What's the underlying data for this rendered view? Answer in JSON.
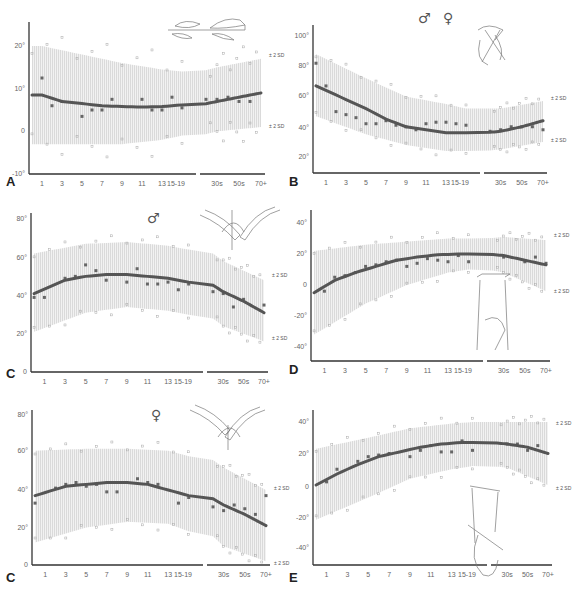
{
  "figure": {
    "panels": [
      "A",
      "B",
      "C (male)",
      "D",
      "C (female)",
      "E"
    ]
  },
  "chart_data": [
    {
      "panel": "A",
      "type": "scatter",
      "title": "",
      "sex_symbols": [],
      "x_tick_labels": [
        "1",
        "3",
        "5",
        "7",
        "9",
        "11",
        "13",
        "15-19",
        "30s",
        "50s",
        "70+"
      ],
      "y_tick_labels": [
        "20°",
        "10°",
        "0",
        "-10°"
      ],
      "ylim": [
        -10,
        25
      ],
      "annotations": [
        "± 2 SD",
        "± 2 SD"
      ],
      "mean_curve": [
        [
          1,
          8.5
        ],
        [
          3,
          7
        ],
        [
          5,
          6.5
        ],
        [
          7,
          6
        ],
        [
          9,
          5.8
        ],
        [
          11,
          5.7
        ],
        [
          13,
          5.8
        ],
        [
          15,
          6.2
        ],
        [
          30,
          7
        ],
        [
          50,
          8
        ],
        [
          70,
          9
        ]
      ],
      "band_upper": [
        [
          1,
          20
        ],
        [
          5,
          18
        ],
        [
          9,
          16
        ],
        [
          13,
          14.5
        ],
        [
          15,
          14
        ],
        [
          30,
          15
        ],
        [
          70,
          17
        ]
      ],
      "band_lower": [
        [
          1,
          -3
        ],
        [
          5,
          -3
        ],
        [
          9,
          -3
        ],
        [
          13,
          -2
        ],
        [
          15,
          -1
        ],
        [
          30,
          0
        ],
        [
          70,
          1
        ]
      ],
      "mean_points": [
        [
          1,
          12.5
        ],
        [
          2,
          6
        ],
        [
          3,
          7
        ],
        [
          5,
          3.5
        ],
        [
          6,
          5
        ],
        [
          7,
          5
        ],
        [
          8,
          7.5
        ],
        [
          11,
          7.5
        ],
        [
          12,
          5
        ],
        [
          13,
          5
        ],
        [
          14,
          8
        ],
        [
          15,
          5.5
        ],
        [
          20,
          7.5
        ],
        [
          30,
          7.5
        ],
        [
          40,
          8
        ],
        [
          50,
          7
        ],
        [
          60,
          7
        ]
      ]
    },
    {
      "panel": "B",
      "type": "scatter",
      "sex_symbols": [
        "♂",
        "♀"
      ],
      "x_tick_labels": [
        "1",
        "3",
        "5",
        "7",
        "9",
        "11",
        "13",
        "15-19",
        "30s",
        "50s",
        "70+"
      ],
      "y_tick_labels": [
        "100°",
        "80°",
        "60°",
        "40°",
        "20°"
      ],
      "ylim": [
        10,
        105
      ],
      "annotations": [
        "± 2 SD",
        "± 2 SD"
      ],
      "mean_curve": [
        [
          0,
          67
        ],
        [
          3,
          58
        ],
        [
          5,
          52
        ],
        [
          7,
          45
        ],
        [
          9,
          40
        ],
        [
          11,
          38
        ],
        [
          13,
          36
        ],
        [
          15,
          36
        ],
        [
          30,
          37
        ],
        [
          50,
          40
        ],
        [
          70,
          44
        ]
      ],
      "band_upper": [
        [
          0,
          88
        ],
        [
          5,
          72
        ],
        [
          9,
          60
        ],
        [
          13,
          55
        ],
        [
          15,
          52
        ],
        [
          30,
          52
        ],
        [
          70,
          57
        ]
      ],
      "band_lower": [
        [
          0,
          47
        ],
        [
          5,
          35
        ],
        [
          9,
          28
        ],
        [
          13,
          24
        ],
        [
          15,
          24
        ],
        [
          30,
          25
        ],
        [
          70,
          30
        ]
      ],
      "mean_points": [
        [
          0,
          82
        ],
        [
          1,
          67
        ],
        [
          2,
          50
        ],
        [
          3,
          48
        ],
        [
          4,
          46
        ],
        [
          5,
          42
        ],
        [
          6,
          42
        ],
        [
          7,
          44
        ],
        [
          8,
          41
        ],
        [
          9,
          40
        ],
        [
          10,
          38
        ],
        [
          11,
          42
        ],
        [
          12,
          43
        ],
        [
          13,
          43
        ],
        [
          14,
          42
        ],
        [
          15,
          41
        ],
        [
          20,
          37
        ],
        [
          30,
          38
        ],
        [
          40,
          40
        ],
        [
          50,
          40
        ],
        [
          60,
          40
        ],
        [
          70,
          38
        ]
      ]
    },
    {
      "panel": "C-male",
      "type": "scatter",
      "sex_symbols": [
        "♂"
      ],
      "x_tick_labels": [
        "1",
        "3",
        "5",
        "7",
        "9",
        "11",
        "13",
        "15-19",
        "30s",
        "50s",
        "70+"
      ],
      "y_tick_labels": [
        "80°",
        "60°",
        "40°",
        "20°",
        "0"
      ],
      "ylim": [
        0,
        80
      ],
      "annotations": [
        "± 2 SD",
        "± 2 SD"
      ],
      "mean_curve": [
        [
          0,
          41
        ],
        [
          3,
          48
        ],
        [
          5,
          50
        ],
        [
          7,
          51
        ],
        [
          9,
          51
        ],
        [
          11,
          50
        ],
        [
          13,
          49
        ],
        [
          15,
          47
        ],
        [
          30,
          42
        ],
        [
          50,
          37
        ],
        [
          70,
          31
        ]
      ],
      "band_upper": [
        [
          0,
          62
        ],
        [
          5,
          67
        ],
        [
          9,
          68
        ],
        [
          13,
          66
        ],
        [
          15,
          64
        ],
        [
          30,
          58
        ],
        [
          70,
          48
        ]
      ],
      "band_lower": [
        [
          0,
          21
        ],
        [
          5,
          31
        ],
        [
          9,
          34
        ],
        [
          13,
          32
        ],
        [
          15,
          30
        ],
        [
          30,
          24
        ],
        [
          70,
          16
        ]
      ],
      "mean_points": [
        [
          0,
          39
        ],
        [
          1,
          39
        ],
        [
          3,
          49
        ],
        [
          4,
          50
        ],
        [
          5,
          56
        ],
        [
          6,
          53
        ],
        [
          7,
          48
        ],
        [
          9,
          47
        ],
        [
          10,
          54
        ],
        [
          11,
          46
        ],
        [
          12,
          46
        ],
        [
          13,
          47
        ],
        [
          14,
          43
        ],
        [
          15,
          46
        ],
        [
          20,
          42
        ],
        [
          30,
          41
        ],
        [
          40,
          34
        ],
        [
          50,
          38
        ],
        [
          70,
          35
        ]
      ]
    },
    {
      "panel": "D",
      "type": "scatter",
      "sex_symbols": [],
      "x_tick_labels": [
        "1",
        "3",
        "5",
        "7",
        "9",
        "11",
        "13",
        "15-19",
        "30s",
        "50s",
        "70+"
      ],
      "y_tick_labels": [
        "40°",
        "20°",
        "0",
        "-20°",
        "-40°"
      ],
      "ylim": [
        -50,
        50
      ],
      "annotations": [
        "± 2 SD",
        "± 2 SD"
      ],
      "mean_curve": [
        [
          0,
          -5
        ],
        [
          2,
          3
        ],
        [
          4,
          8
        ],
        [
          6,
          12
        ],
        [
          8,
          16
        ],
        [
          10,
          18
        ],
        [
          12,
          19.5
        ],
        [
          14,
          20
        ],
        [
          15,
          20
        ],
        [
          30,
          19
        ],
        [
          50,
          16
        ],
        [
          70,
          13
        ]
      ],
      "band_upper": [
        [
          0,
          22
        ],
        [
          5,
          26
        ],
        [
          9,
          28
        ],
        [
          13,
          30
        ],
        [
          15,
          30
        ],
        [
          30,
          31
        ],
        [
          70,
          29
        ]
      ],
      "band_lower": [
        [
          0,
          -32
        ],
        [
          5,
          -12
        ],
        [
          9,
          0
        ],
        [
          13,
          8
        ],
        [
          15,
          10
        ],
        [
          30,
          8
        ],
        [
          70,
          -4
        ]
      ],
      "mean_points": [
        [
          1,
          -4
        ],
        [
          2,
          5
        ],
        [
          3,
          6
        ],
        [
          4,
          8
        ],
        [
          5,
          12
        ],
        [
          6,
          13
        ],
        [
          7,
          15
        ],
        [
          8,
          16
        ],
        [
          9,
          12
        ],
        [
          10,
          14
        ],
        [
          11,
          17
        ],
        [
          12,
          16
        ],
        [
          13,
          15
        ],
        [
          14,
          19
        ],
        [
          15,
          15
        ],
        [
          30,
          18
        ],
        [
          50,
          15
        ],
        [
          60,
          18
        ],
        [
          70,
          14
        ]
      ]
    },
    {
      "panel": "C-female",
      "type": "scatter",
      "sex_symbols": [
        "♀"
      ],
      "x_tick_labels": [
        "1",
        "3",
        "5",
        "7",
        "9",
        "11",
        "13",
        "15-19",
        "30s",
        "50s",
        "70+"
      ],
      "y_tick_labels": [
        "80°",
        "60°",
        "40°",
        "20°",
        "0"
      ],
      "ylim": [
        0,
        80
      ],
      "annotations": [
        "± 2 SD",
        "± 2 SD"
      ],
      "mean_curve": [
        [
          0,
          37
        ],
        [
          3,
          42
        ],
        [
          5,
          43
        ],
        [
          7,
          44
        ],
        [
          9,
          44
        ],
        [
          11,
          43
        ],
        [
          13,
          40
        ],
        [
          15,
          37
        ],
        [
          30,
          32
        ],
        [
          50,
          27
        ],
        [
          70,
          21
        ]
      ],
      "band_upper": [
        [
          0,
          61
        ],
        [
          5,
          62
        ],
        [
          9,
          62
        ],
        [
          13,
          61
        ],
        [
          15,
          58
        ],
        [
          30,
          52
        ],
        [
          70,
          40
        ]
      ],
      "band_lower": [
        [
          0,
          12
        ],
        [
          5,
          20
        ],
        [
          9,
          23
        ],
        [
          13,
          22
        ],
        [
          15,
          18
        ],
        [
          30,
          10
        ],
        [
          70,
          2
        ]
      ],
      "mean_points": [
        [
          0,
          33
        ],
        [
          2,
          41
        ],
        [
          3,
          43
        ],
        [
          4,
          44
        ],
        [
          5,
          42
        ],
        [
          6,
          43
        ],
        [
          7,
          39
        ],
        [
          8,
          39
        ],
        [
          10,
          46
        ],
        [
          11,
          44
        ],
        [
          12,
          43
        ],
        [
          14,
          33
        ],
        [
          15,
          36
        ],
        [
          20,
          31
        ],
        [
          30,
          29
        ],
        [
          40,
          32
        ],
        [
          50,
          30
        ],
        [
          60,
          27
        ],
        [
          70,
          37
        ]
      ]
    },
    {
      "panel": "E",
      "type": "scatter",
      "sex_symbols": [],
      "x_tick_labels": [
        "1",
        "3",
        "5",
        "7",
        "9",
        "11",
        "13",
        "15-19",
        "30s",
        "50s",
        "70+"
      ],
      "y_tick_labels": [
        "40°",
        "20°",
        "0",
        "-20°",
        "-40°"
      ],
      "ylim": [
        -50,
        50
      ],
      "annotations": [
        "± 2 SD",
        "± 2 SD"
      ],
      "mean_curve": [
        [
          0,
          0
        ],
        [
          2,
          7
        ],
        [
          4,
          13
        ],
        [
          6,
          18
        ],
        [
          8,
          21
        ],
        [
          10,
          24
        ],
        [
          12,
          26
        ],
        [
          14,
          27
        ],
        [
          15,
          27
        ],
        [
          30,
          26
        ],
        [
          50,
          24
        ],
        [
          70,
          20
        ]
      ],
      "band_upper": [
        [
          0,
          23
        ],
        [
          5,
          30
        ],
        [
          9,
          36
        ],
        [
          13,
          39
        ],
        [
          15,
          40
        ],
        [
          30,
          40
        ],
        [
          70,
          40
        ]
      ],
      "band_lower": [
        [
          0,
          -22
        ],
        [
          5,
          -8
        ],
        [
          9,
          4
        ],
        [
          13,
          10
        ],
        [
          15,
          12
        ],
        [
          30,
          11
        ],
        [
          70,
          0
        ]
      ],
      "mean_points": [
        [
          1,
          2
        ],
        [
          2,
          10
        ],
        [
          4,
          15
        ],
        [
          5,
          18
        ],
        [
          6,
          19
        ],
        [
          7,
          20
        ],
        [
          9,
          18
        ],
        [
          10,
          22
        ],
        [
          11,
          25
        ],
        [
          12,
          21
        ],
        [
          13,
          21
        ],
        [
          14,
          28
        ],
        [
          15,
          22
        ],
        [
          30,
          26
        ],
        [
          40,
          26
        ],
        [
          50,
          22
        ],
        [
          60,
          25
        ]
      ]
    }
  ],
  "labels": {
    "A": "A",
    "B": "B",
    "C1": "C",
    "C2": "C",
    "D": "D",
    "E": "E",
    "male": "♂",
    "female": "♀",
    "sd": "± 2 SD"
  }
}
